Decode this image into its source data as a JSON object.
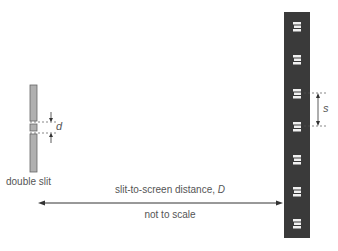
{
  "diagram": {
    "type": "double-slit interference setup",
    "labels": {
      "slit": "double slit",
      "slit_separation": "d",
      "fringe_spacing": "s",
      "distance": "slit-to-screen distance, ",
      "distance_symbol": "D",
      "note": "not to scale"
    },
    "colors": {
      "slit_fill": "#b0b0b0",
      "slit_border": "#666666",
      "screen": "#3a3a3a",
      "fringe": "#f2f2f2",
      "line": "#333333"
    },
    "fringes": {
      "count": 7,
      "y_positions": [
        27,
        60,
        94,
        127,
        160,
        192,
        224
      ]
    }
  }
}
